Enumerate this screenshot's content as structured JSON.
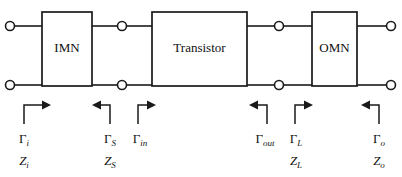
{
  "diagram": {
    "background_color": "#ffffff",
    "line_color": "#1a1a1a",
    "text_color": "#111111",
    "blocks": [
      {
        "id": "imn",
        "label": "IMN",
        "x": 42,
        "y": 12,
        "width": 50,
        "height": 74
      },
      {
        "id": "transistor",
        "label": "Transistor",
        "x": 152,
        "y": 12,
        "width": 95,
        "height": 74
      },
      {
        "id": "omn",
        "label": "OMN",
        "x": 312,
        "y": 12,
        "width": 45,
        "height": 74
      }
    ],
    "terminals": [
      {
        "id": "in-top",
        "cx": 10,
        "cy": 26,
        "r": 4.5
      },
      {
        "id": "in-bottom",
        "cx": 10,
        "cy": 85,
        "r": 4.5
      },
      {
        "id": "mid-left-top",
        "cx": 122,
        "cy": 26,
        "r": 4.5
      },
      {
        "id": "mid-left-bottom",
        "cx": 122,
        "cy": 85,
        "r": 4.5
      },
      {
        "id": "mid-right-top",
        "cx": 279,
        "cy": 26,
        "r": 4.5
      },
      {
        "id": "mid-right-bottom",
        "cx": 279,
        "cy": 85,
        "r": 4.5
      },
      {
        "id": "out-top",
        "cx": 391,
        "cy": 26,
        "r": 4.5
      },
      {
        "id": "out-bottom",
        "cx": 391,
        "cy": 85,
        "r": 4.5
      }
    ],
    "annotations": [
      {
        "id": "input-port",
        "gamma": "Γ",
        "gamma_sub": "i",
        "z": "Z",
        "z_sub": "i",
        "arrow_direction": "right",
        "plane_x": 24,
        "label_x": 24
      },
      {
        "id": "source",
        "gamma": "Γ",
        "gamma_sub": "S",
        "z": "Z",
        "z_sub": "S",
        "arrow_direction": "left",
        "plane_x": 110,
        "label_x": 110
      },
      {
        "id": "transistor-input",
        "gamma": "Γ",
        "gamma_sub": "in",
        "z": "",
        "z_sub": "",
        "arrow_direction": "right",
        "plane_x": 138,
        "label_x": 138
      },
      {
        "id": "transistor-output",
        "gamma": "Γ",
        "gamma_sub": "out",
        "z": "",
        "z_sub": "",
        "arrow_direction": "left",
        "plane_x": 267,
        "label_x": 267
      },
      {
        "id": "load",
        "gamma": "Γ",
        "gamma_sub": "L",
        "z": "Z",
        "z_sub": "L",
        "arrow_direction": "right",
        "plane_x": 295,
        "label_x": 295
      },
      {
        "id": "output-port",
        "gamma": "Γ",
        "gamma_sub": "o",
        "z": "Z",
        "z_sub": "o",
        "arrow_direction": "left",
        "plane_x": 379,
        "label_x": 379
      }
    ]
  }
}
